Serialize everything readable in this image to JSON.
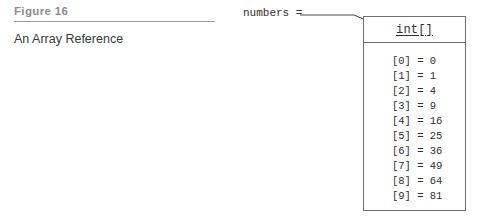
{
  "figure": {
    "label": "Figure 16",
    "caption": "An Array Reference"
  },
  "reference": {
    "variable_expression": "numbers =",
    "arrow": "arrow-right"
  },
  "array_object": {
    "type_name": "int[]",
    "elements": [
      {
        "index_label": "[0]",
        "assignment": "[0] = 0",
        "value": 0
      },
      {
        "index_label": "[1]",
        "assignment": "[1] = 1",
        "value": 1
      },
      {
        "index_label": "[2]",
        "assignment": "[2] = 4",
        "value": 4
      },
      {
        "index_label": "[3]",
        "assignment": "[3] = 9",
        "value": 9
      },
      {
        "index_label": "[4]",
        "assignment": "[4] = 16",
        "value": 16
      },
      {
        "index_label": "[5]",
        "assignment": "[5] = 25",
        "value": 25
      },
      {
        "index_label": "[6]",
        "assignment": "[6] = 36",
        "value": 36
      },
      {
        "index_label": "[7]",
        "assignment": "[7] = 49",
        "value": 49
      },
      {
        "index_label": "[8]",
        "assignment": "[8] = 64",
        "value": 64
      },
      {
        "index_label": "[9]",
        "assignment": "[9] = 81",
        "value": 81
      }
    ]
  },
  "colors": {
    "label_gray": "#8d8d8d",
    "rule_gray": "#9a9a9a",
    "text_dark": "#2f2f2f",
    "box_border": "#6f6f6f",
    "background": "#ffffff"
  }
}
